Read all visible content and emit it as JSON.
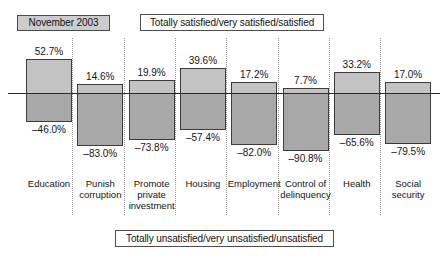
{
  "date_badge": {
    "label": "November 2003"
  },
  "captions": {
    "top": "Totally satisfied/very satisfied/satisfied",
    "bottom": "Totally unsatisfied/very unsatisfied/unsatisfied"
  },
  "colors": {
    "positive_bar": "#c3c3c3",
    "negative_bar": "#a8a8a8",
    "bar_border": "#3c3c3c",
    "badge_fill": "#cccccc",
    "axis_line": "#2b2b2b",
    "separator": "#9a9a9a",
    "background": "#ffffff",
    "text": "#141414"
  },
  "chart_data": {
    "type": "bar",
    "title": "",
    "subtitle": "",
    "xlabel": "",
    "ylabel": "",
    "ylim": [
      -100,
      60
    ],
    "grid": false,
    "legend_position": "none",
    "orientation": "vertical",
    "layout": "diverging-bidirectional",
    "categories": [
      "Education",
      "Punish corruption",
      "Promote private investment",
      "Housing",
      "Employment",
      "Control of delinquency",
      "Health",
      "Social security"
    ],
    "series": [
      {
        "name": "Totally satisfied/very satisfied/satisfied",
        "values": [
          52.7,
          14.6,
          19.9,
          39.6,
          17.2,
          7.7,
          33.2,
          17.0
        ],
        "labels": [
          "52.7%",
          "14.6%",
          "19.9%",
          "39.6%",
          "17.2%",
          "7.7%",
          "33.2%",
          "17.0%"
        ]
      },
      {
        "name": "Totally unsatisfied/very unsatisfied/unsatisfied",
        "values": [
          -46.0,
          -83.0,
          -73.8,
          -57.4,
          -82.0,
          -90.8,
          -65.6,
          -79.5
        ],
        "labels": [
          "–46.0%",
          "–83.0%",
          "–73.8%",
          "–57.4%",
          "–82.0%",
          "–90.8%",
          "–65.6%",
          "–79.5%"
        ]
      }
    ]
  },
  "category_lines": [
    [
      "Education"
    ],
    [
      "Punish",
      "corruption"
    ],
    [
      "Promote",
      "private",
      "investment"
    ],
    [
      "Housing"
    ],
    [
      "Employment"
    ],
    [
      "Control of",
      "delinquency"
    ],
    [
      "Health"
    ],
    [
      "Social",
      "security"
    ]
  ]
}
